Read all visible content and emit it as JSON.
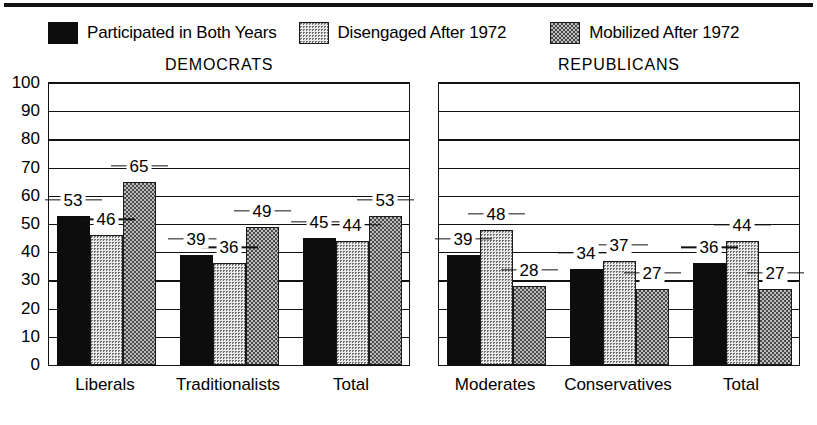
{
  "legend": {
    "items": [
      {
        "label": "Participated in Both Years",
        "swatch": "solid-black-swatch",
        "fill": "solid"
      },
      {
        "label": "Disengaged After 1972",
        "swatch": "light-stipple-swatch",
        "fill": "stipple"
      },
      {
        "label": "Mobilized After 1972",
        "swatch": "checkerboard-swatch",
        "fill": "check"
      }
    ]
  },
  "chart_data": {
    "type": "bar",
    "title": "",
    "xlabel": "",
    "ylabel": "",
    "ylim": [
      0,
      100
    ],
    "yticks": [
      0,
      10,
      20,
      30,
      40,
      50,
      60,
      70,
      80,
      90,
      100
    ],
    "grid": true,
    "legend_position": "top",
    "series": [
      {
        "name": "Participated in Both Years",
        "fill": "solid"
      },
      {
        "name": "Disengaged After 1972",
        "fill": "stipple"
      },
      {
        "name": "Mobilized After 1972",
        "fill": "check"
      }
    ],
    "panels": [
      {
        "title": "DEMOCRATS",
        "categories": [
          "Liberals",
          "Traditionalists",
          "Total"
        ],
        "values": [
          [
            53,
            46,
            65
          ],
          [
            39,
            36,
            49
          ],
          [
            45,
            44,
            53
          ]
        ]
      },
      {
        "title": "REPUBLICANS",
        "categories": [
          "Moderates",
          "Conservatives",
          "Total"
        ],
        "values": [
          [
            39,
            48,
            28
          ],
          [
            34,
            37,
            27
          ],
          [
            36,
            44,
            27
          ]
        ]
      }
    ]
  },
  "colors": {
    "ink": "#111111",
    "solid_bar": "#0d0d0d",
    "stipple_bar": "#e9e9e9",
    "check_bar": "#bdbdbd",
    "background": "#ffffff"
  }
}
